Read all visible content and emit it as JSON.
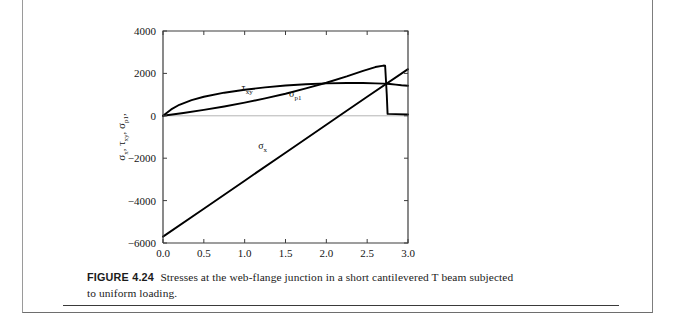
{
  "figure": {
    "number_label": "FIGURE 4.24",
    "caption_text": "Stresses at the web-flange junction in a short cantilevered T beam subjected to uniform loading."
  },
  "chart_data": {
    "type": "line",
    "title": "",
    "xlabel": "Y",
    "xlabel_units": "(in.)",
    "ylabel_parts": [
      "σ",
      "x",
      "τ",
      "xy",
      "σ",
      "p1",
      "(psi)"
    ],
    "ylabel_plain": "σx , τxy , σp1 ,  (psi)",
    "xlim": [
      0.0,
      3.0
    ],
    "ylim": [
      -6000,
      4000
    ],
    "xticks": [
      "0.0",
      "0.5",
      "1.0",
      "1.5",
      "2.0",
      "2.5",
      "3.0"
    ],
    "xtick_values": [
      0.0,
      0.5,
      1.0,
      1.5,
      2.0,
      2.5,
      3.0
    ],
    "yticks": [
      "4000",
      "2000",
      "0",
      "-2000",
      "-4000",
      "-6000"
    ],
    "ytick_values": [
      4000,
      2000,
      0,
      -2000,
      -4000,
      -6000
    ],
    "grid": false,
    "zero_line": true,
    "legend": "inline-curve-labels",
    "series": [
      {
        "name": "τxy",
        "label_main": "τ",
        "label_sub": "xy",
        "label_x": 1.03,
        "label_y": 1180,
        "color": "#000000",
        "points": [
          [
            0.0,
            0
          ],
          [
            0.1,
            300
          ],
          [
            0.2,
            520
          ],
          [
            0.35,
            740
          ],
          [
            0.5,
            900
          ],
          [
            0.75,
            1090
          ],
          [
            1.0,
            1230
          ],
          [
            1.25,
            1340
          ],
          [
            1.5,
            1430
          ],
          [
            1.75,
            1490
          ],
          [
            2.0,
            1530
          ],
          [
            2.25,
            1550
          ],
          [
            2.45,
            1545
          ],
          [
            2.6,
            1530
          ],
          [
            2.7,
            1520
          ],
          [
            2.78,
            1500
          ],
          [
            2.85,
            1470
          ],
          [
            2.92,
            1440
          ],
          [
            3.0,
            1420
          ]
        ]
      },
      {
        "name": "σp1",
        "label_main": "σ",
        "label_sub": "p1",
        "label_x": 1.62,
        "label_y": 880,
        "color": "#000000",
        "points": [
          [
            0.0,
            0
          ],
          [
            0.25,
            130
          ],
          [
            0.5,
            280
          ],
          [
            0.75,
            440
          ],
          [
            1.0,
            620
          ],
          [
            1.25,
            820
          ],
          [
            1.5,
            1040
          ],
          [
            1.75,
            1290
          ],
          [
            2.0,
            1560
          ],
          [
            2.25,
            1860
          ],
          [
            2.45,
            2120
          ],
          [
            2.6,
            2300
          ],
          [
            2.7,
            2370
          ],
          [
            2.72,
            2360
          ],
          [
            2.74,
            1000
          ],
          [
            2.75,
            90
          ],
          [
            2.85,
            80
          ],
          [
            3.0,
            60
          ]
        ]
      },
      {
        "name": "σx",
        "label_main": "σ",
        "label_sub": "x",
        "label_x": 1.22,
        "label_y": -1560,
        "color": "#000000",
        "points": [
          [
            0.0,
            -5700
          ],
          [
            0.5,
            -4380
          ],
          [
            1.0,
            -3060
          ],
          [
            1.5,
            -1740
          ],
          [
            2.0,
            -420
          ],
          [
            2.16,
            0
          ],
          [
            2.5,
            900
          ],
          [
            3.0,
            2200
          ]
        ]
      }
    ]
  }
}
